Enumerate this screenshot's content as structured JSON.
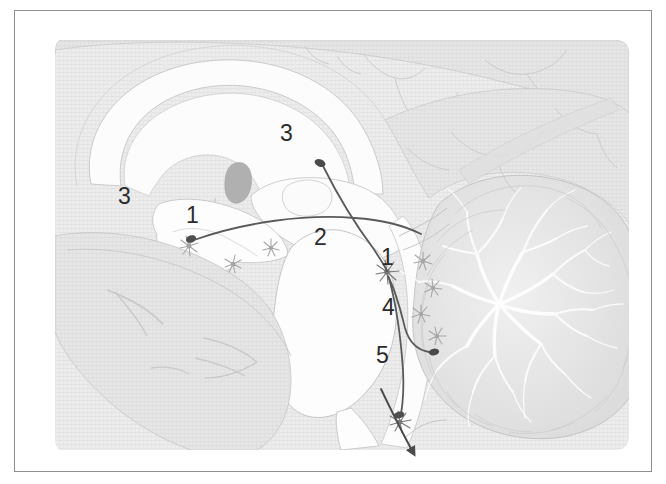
{
  "figure": {
    "kind": "anatomical-illustration",
    "view": "midsagittal-brain-section",
    "panel_background": "#efefef",
    "outline_color": "#b9b9b9",
    "tract_color": "#555555",
    "label_color": "#2b2b2b",
    "frame_color": "#8d8d8d",
    "page_color": "#ffffff",
    "neuron_color": "#9a9a9a",
    "bouton_color": "#4a4a4a"
  },
  "labels": [
    {
      "id": "label-3-left",
      "text": "3",
      "x": 143,
      "y": 209
    },
    {
      "id": "label-1-left",
      "text": "1",
      "x": 211,
      "y": 228
    },
    {
      "id": "label-3-top",
      "text": "3",
      "x": 305,
      "y": 146
    },
    {
      "id": "label-2",
      "text": "2",
      "x": 339,
      "y": 250
    },
    {
      "id": "label-1-right",
      "text": "1",
      "x": 406,
      "y": 270
    },
    {
      "id": "label-4",
      "text": "4",
      "x": 407,
      "y": 320
    },
    {
      "id": "label-5",
      "text": "5",
      "x": 401,
      "y": 368
    }
  ],
  "structures": [
    {
      "id": "cerebral-cortex",
      "name": "cerebral cortex"
    },
    {
      "id": "corpus-callosum",
      "name": "corpus callosum"
    },
    {
      "id": "thalamus",
      "name": "thalamus"
    },
    {
      "id": "septum-fornix",
      "name": "septum / fornix"
    },
    {
      "id": "hypothalamus",
      "name": "hypothalamus"
    },
    {
      "id": "midbrain",
      "name": "midbrain"
    },
    {
      "id": "pons",
      "name": "pons"
    },
    {
      "id": "medulla",
      "name": "medulla oblongata"
    },
    {
      "id": "cerebellum",
      "name": "cerebellum (arbor vitae)"
    },
    {
      "id": "spinal-cord",
      "name": "spinal cord"
    }
  ],
  "pathways": [
    {
      "id": "pathway-ascending-forebrain",
      "from": "brainstem cell group",
      "to": "basal forebrain terminal",
      "terminal_label": "3"
    },
    {
      "id": "pathway-to-cerebellum",
      "from": "brainstem cell group 2",
      "to": "cerebellar terminal",
      "terminal_label": "4"
    },
    {
      "id": "pathway-descending-spinal",
      "from": "brainstem cell group 2",
      "to": "spinal cord",
      "terminal_label": "5"
    }
  ]
}
